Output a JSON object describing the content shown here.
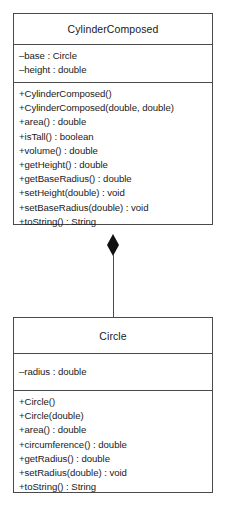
{
  "diagram": {
    "type": "uml-class-diagram",
    "notation": "UML",
    "background_color": "#ffffff",
    "line_color": "#4a4a4a",
    "text_color": "#1a1a1a",
    "relationship": {
      "name": "composition",
      "kind": "composition",
      "marker": "filled-diamond",
      "source": "CylinderComposed",
      "target": "Circle",
      "marker_color": "#111111"
    },
    "classes": [
      {
        "id": "cylinder-composed",
        "name": "CylinderComposed",
        "attributes": [
          "–base : Circle",
          "–height : double"
        ],
        "operations": [
          "+CylinderComposed()",
          "+CylinderComposed(double, double)",
          "+area() : double",
          "+isTall() : boolean",
          "+volume() : double",
          "+getHeight() : double",
          "+getBaseRadius() : double",
          "+setHeight(double) : void",
          "+setBaseRadius(double) : void",
          "+toString() : String"
        ]
      },
      {
        "id": "circle",
        "name": "Circle",
        "attributes": [
          "–radius : double"
        ],
        "operations": [
          "+Circle()",
          "+Circle(double)",
          "+area() : double",
          "+circumference() : double",
          "+getRadius() : double",
          "+setRadius(double) : void",
          "+toString() : String"
        ]
      }
    ]
  },
  "caption": ""
}
